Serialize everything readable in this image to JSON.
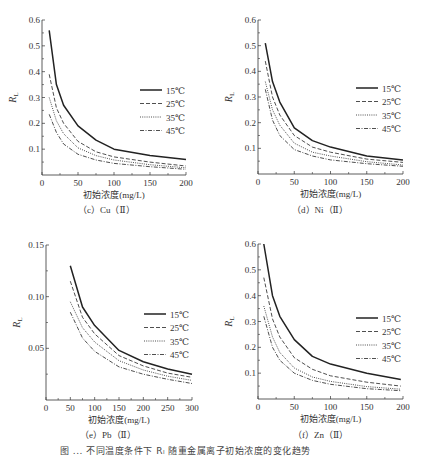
{
  "figure_caption": "图 ... 不同温度条件下 Rₗ 随重金属离子初始浓度的变化趋势",
  "chart_data": [
    {
      "id": "c",
      "type": "line",
      "title": "",
      "caption": "（c）Cu（Ⅱ）",
      "xlabel": "初始浓度(mg/L)",
      "ylabel": "R_L",
      "xlim": [
        0,
        200
      ],
      "ylim": [
        0,
        0.6
      ],
      "xticks": [
        0,
        50,
        100,
        150,
        200
      ],
      "yticks": [
        0.1,
        0.2,
        0.3,
        0.4,
        0.5,
        0.6
      ],
      "ytick_labels": [
        "0.1",
        "0.2",
        "0.3",
        "0.4",
        "0.5",
        "0.6"
      ],
      "grid": false,
      "legend_position": "right-middle",
      "x": [
        10,
        20,
        30,
        50,
        75,
        100,
        150,
        200
      ],
      "series": [
        {
          "name": "15℃",
          "style": "solid",
          "values": [
            0.56,
            0.35,
            0.27,
            0.19,
            0.135,
            0.1,
            0.075,
            0.06
          ]
        },
        {
          "name": "25℃",
          "style": "dashed",
          "values": [
            0.39,
            0.26,
            0.2,
            0.13,
            0.09,
            0.07,
            0.05,
            0.035
          ]
        },
        {
          "name": "35℃",
          "style": "dotted",
          "values": [
            0.3,
            0.21,
            0.16,
            0.105,
            0.075,
            0.058,
            0.04,
            0.028
          ]
        },
        {
          "name": "45℃",
          "style": "dashdot",
          "values": [
            0.235,
            0.165,
            0.12,
            0.08,
            0.058,
            0.045,
            0.032,
            0.022
          ]
        }
      ]
    },
    {
      "id": "d",
      "type": "line",
      "title": "",
      "caption": "（d）Ni（Ⅱ）",
      "xlabel": "初始浓度(mg/L)",
      "ylabel": "R_L",
      "xlim": [
        0,
        200
      ],
      "ylim": [
        0,
        0.6
      ],
      "xticks": [
        0,
        50,
        100,
        150,
        200
      ],
      "yticks": [
        0.1,
        0.2,
        0.3,
        0.4,
        0.5,
        0.6
      ],
      "ytick_labels": [
        "0.1",
        "0.2",
        "0.3",
        "0.4",
        "0.5",
        "0.6"
      ],
      "grid": false,
      "legend_position": "right-middle",
      "x": [
        10,
        20,
        30,
        50,
        75,
        100,
        150,
        200
      ],
      "series": [
        {
          "name": "15℃",
          "style": "solid",
          "values": [
            0.51,
            0.36,
            0.28,
            0.18,
            0.13,
            0.105,
            0.07,
            0.055
          ]
        },
        {
          "name": "25℃",
          "style": "dashed",
          "values": [
            0.44,
            0.3,
            0.23,
            0.15,
            0.105,
            0.085,
            0.058,
            0.045
          ]
        },
        {
          "name": "35℃",
          "style": "dotted",
          "values": [
            0.36,
            0.25,
            0.19,
            0.12,
            0.085,
            0.07,
            0.048,
            0.035
          ]
        },
        {
          "name": "45℃",
          "style": "dashdot",
          "values": [
            0.33,
            0.21,
            0.15,
            0.095,
            0.07,
            0.055,
            0.04,
            0.03
          ]
        }
      ]
    },
    {
      "id": "e",
      "type": "line",
      "title": "",
      "caption": "（e）Pb（Ⅱ）",
      "xlabel": "初始浓度(mg/L)",
      "ylabel": "R_L",
      "xlim": [
        0,
        300
      ],
      "ylim": [
        0,
        0.15
      ],
      "xticks": [
        0,
        50,
        100,
        150,
        200,
        250,
        300
      ],
      "yticks": [
        0.05,
        0.1,
        0.15
      ],
      "ytick_labels": [
        "0.05",
        "0.10",
        "0.15"
      ],
      "grid": false,
      "legend_position": "right-middle",
      "x": [
        50,
        75,
        100,
        150,
        200,
        250,
        300
      ],
      "series": [
        {
          "name": "15℃",
          "style": "solid",
          "values": [
            0.13,
            0.09,
            0.072,
            0.048,
            0.037,
            0.03,
            0.025
          ]
        },
        {
          "name": "25℃",
          "style": "dashed",
          "values": [
            0.115,
            0.08,
            0.064,
            0.043,
            0.033,
            0.026,
            0.022
          ]
        },
        {
          "name": "35℃",
          "style": "dotted",
          "values": [
            0.095,
            0.07,
            0.056,
            0.038,
            0.029,
            0.023,
            0.019
          ]
        },
        {
          "name": "45℃",
          "style": "dashdot",
          "values": [
            0.085,
            0.06,
            0.047,
            0.032,
            0.025,
            0.02,
            0.016
          ]
        }
      ]
    },
    {
      "id": "f",
      "type": "line",
      "title": "",
      "caption": "（f）Zn（Ⅱ）",
      "xlabel": "初始浓度(mg/L)",
      "ylabel": "R_L",
      "xlim": [
        0,
        200
      ],
      "ylim": [
        0,
        0.6
      ],
      "xticks": [
        0,
        50,
        100,
        150,
        200
      ],
      "yticks": [
        0.1,
        0.2,
        0.3,
        0.4,
        0.5,
        0.6
      ],
      "ytick_labels": [
        "0.1",
        "0.2",
        "0.3",
        "0.4",
        "0.5",
        "0.6"
      ],
      "grid": false,
      "legend_position": "right-middle",
      "x": [
        8,
        20,
        30,
        50,
        75,
        100,
        150,
        197
      ],
      "series": [
        {
          "name": "15℃",
          "style": "solid",
          "values": [
            0.6,
            0.4,
            0.32,
            0.23,
            0.165,
            0.135,
            0.1,
            0.075
          ]
        },
        {
          "name": "25℃",
          "style": "dashed",
          "values": [
            0.47,
            0.31,
            0.24,
            0.16,
            0.115,
            0.09,
            0.065,
            0.05
          ]
        },
        {
          "name": "35℃",
          "style": "dotted",
          "values": [
            0.36,
            0.24,
            0.18,
            0.12,
            0.085,
            0.068,
            0.048,
            0.038
          ]
        },
        {
          "name": "45℃",
          "style": "dashdot",
          "values": [
            0.32,
            0.2,
            0.15,
            0.1,
            0.072,
            0.057,
            0.04,
            0.032
          ]
        }
      ]
    }
  ]
}
